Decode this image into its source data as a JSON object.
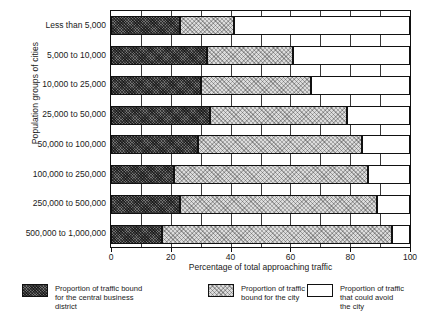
{
  "chart_data": {
    "type": "bar",
    "orientation": "horizontal",
    "stacked": true,
    "title": "",
    "xlabel": "Percentage of total approaching traffic",
    "ylabel": "Population groups of cities",
    "xlim": [
      0,
      100
    ],
    "xticks": [
      0,
      20,
      40,
      60,
      80,
      100
    ],
    "xtick_labels": [
      "0",
      "20",
      "40",
      "60",
      "80",
      "100"
    ],
    "gridlines_every": 10,
    "grid": true,
    "legend_position": "below",
    "categories": [
      "Less than 5,000",
      "5,000 to 10,000",
      "10,000 to 25,000",
      "25,000 to 50,000",
      "50,000 to 100,000",
      "100,000 to 250,000",
      "250,000 to 500,000",
      "500,000 to 1,000,000"
    ],
    "series": [
      {
        "name": "Proportion of traffic bound for the central business district",
        "fill": "dark-hatch",
        "values": [
          23,
          32,
          30,
          33,
          29,
          21,
          23,
          17
        ]
      },
      {
        "name": "Proportion of traffic bound for the city",
        "fill": "light-stipple",
        "values": [
          18,
          29,
          37,
          46,
          55,
          65,
          66,
          77
        ]
      },
      {
        "name": "Proportion of traffic that could avoid the city",
        "fill": "white",
        "values": [
          59,
          39,
          33,
          21,
          16,
          14,
          11,
          6
        ]
      }
    ],
    "cumulative_boundaries": [
      [
        23,
        41
      ],
      [
        32,
        61
      ],
      [
        30,
        67
      ],
      [
        33,
        79
      ],
      [
        29,
        84
      ],
      [
        21,
        86
      ],
      [
        23,
        89
      ],
      [
        17,
        94
      ]
    ]
  },
  "legend": {
    "items": [
      {
        "label": "Proportion of traffic bound\nfor the central business\ndistrict",
        "swatch": "dark-hatch-swatch"
      },
      {
        "label": "Proportion of traffic\nbound for the city",
        "swatch": "light-stipple-swatch"
      },
      {
        "label": "Proportion of traffic\nthat could avoid\nthe city",
        "swatch": "white-swatch"
      }
    ]
  },
  "colors": {
    "dark": "#6f6f6f",
    "light": "#dcdcdc",
    "white": "#ffffff",
    "axis": "#111111",
    "grid": "#3a3a3a"
  }
}
